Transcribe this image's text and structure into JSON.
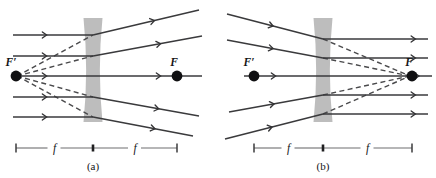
{
  "figure": {
    "type": "optics-ray-diagram",
    "background_color": "#ffffff",
    "ray_color": "#3a3a3c",
    "lens_color": "#b4b4b4",
    "dot_color": "#101012",
    "ruler_color": "#6e6e70"
  },
  "panels": [
    {
      "id": "a",
      "caption": "(a)",
      "description": "Parallel rays entering a diverging lens spread apart; extensions appear to come from near focal point F-prime",
      "lens": {
        "name": "diverging-lens",
        "center_x": 93,
        "top_y": 18,
        "bottom_y": 122,
        "edge_half_width": 9.5,
        "waist_half_width": 4.2
      },
      "focal_points": [
        {
          "name": "F-prime",
          "label": "F′",
          "x": 16,
          "y": 76,
          "label_x": 11,
          "label_y": 66,
          "radius": 5.4
        },
        {
          "name": "F",
          "label": "F",
          "x": 177,
          "y": 76,
          "label_x": 174,
          "label_y": 66,
          "radius": 5.4
        }
      ],
      "optical_axis": {
        "x1": 13,
        "x2": 202,
        "y": 76
      },
      "rays": [
        {
          "name": "ray-1",
          "incoming": [
            13,
            35,
            93,
            35
          ],
          "outgoing": [
            93,
            35,
            199,
            10
          ],
          "arrow_in_t": 0.42,
          "arrow_out_t": 0.58
        },
        {
          "name": "ray-2",
          "incoming": [
            13,
            56,
            93,
            56
          ],
          "outgoing": [
            93,
            56,
            202,
            36
          ],
          "arrow_in_t": 0.42,
          "arrow_out_t": 0.62
        },
        {
          "name": "ray-3",
          "incoming": [
            13,
            76,
            93,
            76
          ],
          "outgoing": [
            93,
            76,
            202,
            76
          ],
          "arrow_in_t": 0.42,
          "arrow_out_t": 0.62
        },
        {
          "name": "ray-4",
          "incoming": [
            13,
            97,
            93,
            97
          ],
          "outgoing": [
            93,
            97,
            199,
            116
          ],
          "arrow_in_t": 0.42,
          "arrow_out_t": 0.62
        },
        {
          "name": "ray-5",
          "incoming": [
            13,
            117,
            93,
            117
          ],
          "outgoing": [
            93,
            117,
            193,
            136
          ],
          "arrow_in_t": 0.42,
          "arrow_out_t": 0.62
        }
      ],
      "virtual_extensions": [
        {
          "name": "virtual-ray-1",
          "from": [
            17,
            76
          ],
          "to": [
            93,
            35
          ]
        },
        {
          "name": "virtual-ray-2",
          "from": [
            17,
            76
          ],
          "to": [
            93,
            56
          ]
        },
        {
          "name": "virtual-ray-4",
          "from": [
            17,
            76
          ],
          "to": [
            93,
            97
          ]
        },
        {
          "name": "virtual-ray-5",
          "from": [
            17,
            76
          ],
          "to": [
            93,
            117
          ]
        }
      ],
      "ruler": {
        "name": "focal-length-ruler",
        "y": 148,
        "left_x": 16,
        "center_x": 93,
        "right_x": 177,
        "left_label": "f",
        "right_label": "f"
      }
    },
    {
      "id": "b",
      "caption": "(b)",
      "description": "Converging rays aimed at focal point F are refracted by the diverging lens into parallel rays",
      "lens": {
        "name": "diverging-lens",
        "center_x": 323,
        "top_y": 18,
        "bottom_y": 122,
        "edge_half_width": 9.5,
        "waist_half_width": 4.2
      },
      "focal_points": [
        {
          "name": "F-prime",
          "label": "F′",
          "x": 254,
          "y": 76,
          "label_x": 249,
          "label_y": 66,
          "radius": 5.4
        },
        {
          "name": "F",
          "label": "F",
          "x": 412,
          "y": 76,
          "label_x": 409,
          "label_y": 66,
          "radius": 5.4
        }
      ],
      "optical_axis": {
        "x1": 244,
        "x2": 432,
        "y": 76
      },
      "rays": [
        {
          "name": "ray-1",
          "incoming": [
            227,
            14,
            323,
            39
          ],
          "outgoing": [
            323,
            39,
            428,
            39
          ],
          "arrow_in_t": 0.48,
          "arrow_out_t": 0.88
        },
        {
          "name": "ray-2",
          "incoming": [
            227,
            40,
            323,
            58
          ],
          "outgoing": [
            323,
            58,
            428,
            58
          ],
          "arrow_in_t": 0.48,
          "arrow_out_t": 0.88
        },
        {
          "name": "ray-3",
          "incoming": [
            244,
            76,
            323,
            76
          ],
          "outgoing": [
            323,
            76,
            432,
            76
          ],
          "arrow_in_t": 0.4,
          "arrow_out_t": 0.88
        },
        {
          "name": "ray-4",
          "incoming": [
            229,
            112,
            323,
            95
          ],
          "outgoing": [
            323,
            95,
            428,
            95
          ],
          "arrow_in_t": 0.48,
          "arrow_out_t": 0.88
        },
        {
          "name": "ray-5",
          "incoming": [
            225,
            139,
            323,
            114
          ],
          "outgoing": [
            323,
            114,
            428,
            114
          ],
          "arrow_in_t": 0.48,
          "arrow_out_t": 0.88
        }
      ],
      "virtual_extensions": [
        {
          "name": "virtual-ray-1",
          "from": [
            323,
            39
          ],
          "to": [
            410,
            76
          ]
        },
        {
          "name": "virtual-ray-2",
          "from": [
            323,
            58
          ],
          "to": [
            410,
            76
          ]
        },
        {
          "name": "virtual-ray-4",
          "from": [
            323,
            95
          ],
          "to": [
            410,
            76
          ]
        },
        {
          "name": "virtual-ray-5",
          "from": [
            323,
            114
          ],
          "to": [
            410,
            76
          ]
        }
      ],
      "ruler": {
        "name": "focal-length-ruler",
        "y": 148,
        "left_x": 254,
        "center_x": 323,
        "right_x": 412,
        "left_label": "f",
        "right_label": "f"
      }
    }
  ]
}
